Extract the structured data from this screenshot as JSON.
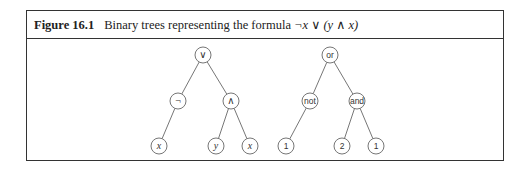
{
  "figure": {
    "label": "Figure 16.1",
    "caption_text": "Binary trees representing the formula ",
    "caption_formula": "¬x ∨ (y ∧ x)"
  },
  "trees": [
    {
      "name": "symbolic-tree",
      "style": "math",
      "nodes": [
        {
          "id": "root",
          "label": "∨",
          "x": 203,
          "y": 55
        },
        {
          "id": "not",
          "label": "¬",
          "x": 178,
          "y": 101
        },
        {
          "id": "and",
          "label": "∧",
          "x": 231,
          "y": 101
        },
        {
          "id": "x1",
          "label": "x",
          "x": 159,
          "y": 146
        },
        {
          "id": "y",
          "label": "y",
          "x": 216,
          "y": 146
        },
        {
          "id": "x2",
          "label": "x",
          "x": 250,
          "y": 146
        }
      ],
      "edges": [
        [
          "root",
          "not"
        ],
        [
          "root",
          "and"
        ],
        [
          "not",
          "x1"
        ],
        [
          "and",
          "y"
        ],
        [
          "and",
          "x2"
        ]
      ]
    },
    {
      "name": "encoded-tree",
      "style": "sans",
      "nodes": [
        {
          "id": "root",
          "label": "or",
          "x": 330,
          "y": 55
        },
        {
          "id": "not",
          "label": "not",
          "x": 310,
          "y": 101
        },
        {
          "id": "and",
          "label": "and",
          "x": 357,
          "y": 101
        },
        {
          "id": "l1",
          "label": "1",
          "x": 286,
          "y": 146
        },
        {
          "id": "l2",
          "label": "2",
          "x": 342,
          "y": 146
        },
        {
          "id": "l3",
          "label": "1",
          "x": 376,
          "y": 146
        }
      ],
      "edges": [
        [
          "root",
          "not"
        ],
        [
          "root",
          "and"
        ],
        [
          "not",
          "l1"
        ],
        [
          "and",
          "l2"
        ],
        [
          "and",
          "l3"
        ]
      ]
    }
  ],
  "node_radius": 8
}
